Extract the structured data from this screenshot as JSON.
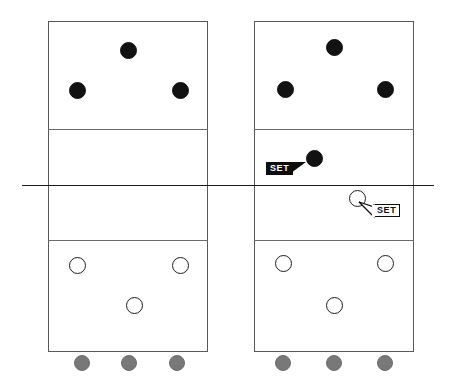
{
  "diagram": {
    "type": "volleyball-court-pair",
    "colors": {
      "court_line": "#58585a",
      "zone_line": "#6a6a6c",
      "net_line": "#1b1b1b",
      "dark_player": "#121212",
      "open_player": "#ffffff",
      "bench_player": "#78787a",
      "tag_filled_bg": "#0d0d0d",
      "tag_filled_text": "#ffffff",
      "tag_outline_bg": "#ffffff",
      "tag_outline_text": "#0d0d0d"
    },
    "courts": [
      {
        "id": "left-court",
        "name": "Left Court Diagram",
        "frame": {
          "x": 48,
          "y": 21,
          "w": 160,
          "h": 331
        },
        "zone_lines": [
          {
            "name": "far-attack-line",
            "y": 129
          },
          {
            "name": "near-attack-line",
            "y": 240
          }
        ],
        "dark_players": [
          {
            "name": "far-middle-front",
            "x": 128,
            "y": 50
          },
          {
            "name": "far-left-front",
            "x": 77,
            "y": 90
          },
          {
            "name": "far-right-front",
            "x": 180,
            "y": 90
          }
        ],
        "open_players": [
          {
            "name": "near-left-back",
            "x": 77,
            "y": 265
          },
          {
            "name": "near-right-back",
            "x": 180,
            "y": 265
          },
          {
            "name": "near-middle-back",
            "x": 134,
            "y": 305
          }
        ],
        "bench_players": [
          {
            "name": "bench-1",
            "x": 82,
            "y": 362
          },
          {
            "name": "bench-2",
            "x": 129,
            "y": 362
          },
          {
            "name": "bench-3",
            "x": 177,
            "y": 362
          }
        ],
        "set_tags": []
      },
      {
        "id": "right-court",
        "name": "Right Court Diagram",
        "frame": {
          "x": 254,
          "y": 21,
          "w": 160,
          "h": 331
        },
        "zone_lines": [
          {
            "name": "far-attack-line",
            "y": 129
          },
          {
            "name": "near-attack-line",
            "y": 240
          }
        ],
        "dark_players": [
          {
            "name": "far-middle-front",
            "x": 334,
            "y": 47
          },
          {
            "name": "far-left-front",
            "x": 285,
            "y": 89
          },
          {
            "name": "far-right-front",
            "x": 385,
            "y": 89
          },
          {
            "name": "far-setter",
            "x": 314,
            "y": 158
          }
        ],
        "open_players": [
          {
            "name": "near-setter",
            "x": 357,
            "y": 198
          },
          {
            "name": "near-left-back",
            "x": 283,
            "y": 263
          },
          {
            "name": "near-right-back",
            "x": 385,
            "y": 263
          },
          {
            "name": "near-middle-back",
            "x": 334,
            "y": 305
          }
        ],
        "bench_players": [
          {
            "name": "bench-1",
            "x": 283,
            "y": 362
          },
          {
            "name": "bench-2",
            "x": 334,
            "y": 362
          },
          {
            "name": "bench-3",
            "x": 385,
            "y": 362
          }
        ],
        "set_tags": [
          {
            "name": "set-tag-far",
            "label": "SET",
            "style": "filled",
            "x": 266,
            "y": 162,
            "points_to": "far-setter"
          },
          {
            "name": "set-tag-near",
            "label": "SET",
            "style": "outlined",
            "x": 373,
            "y": 204,
            "points_to": "near-setter"
          }
        ]
      }
    ],
    "net": {
      "name": "net-line",
      "y": 185,
      "x_start": 22,
      "x_end": 434
    }
  }
}
